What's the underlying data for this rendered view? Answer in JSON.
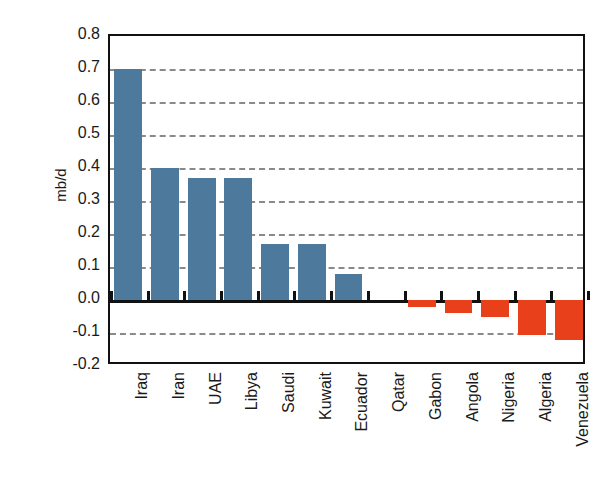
{
  "chart_data": {
    "type": "bar",
    "title": "",
    "xlabel": "",
    "ylabel": "mb/d",
    "ylim": [
      -0.2,
      0.8
    ],
    "ytick_step": 0.1,
    "grid": true,
    "grid_style": "dashed",
    "legend": "none",
    "categories": [
      "Iraq",
      "Iran",
      "UAE",
      "Libya",
      "Saudi",
      "Kuwait",
      "Ecuador",
      "Qatar",
      "Gabon",
      "Angola",
      "Nigeria",
      "Algeria",
      "Venezuela"
    ],
    "values": [
      0.7,
      0.4,
      0.37,
      0.37,
      0.17,
      0.17,
      0.08,
      0.0,
      -0.02,
      -0.04,
      -0.05,
      -0.105,
      -0.12
    ],
    "ytick_labels": [
      "0.8",
      "0.7",
      "0.6",
      "0.5",
      "0.4",
      "0.3",
      "0.2",
      "0.1",
      "0.0",
      "-0.1",
      "-0.2"
    ],
    "ytick_values": [
      0.8,
      0.7,
      0.6,
      0.5,
      0.4,
      0.3,
      0.2,
      0.1,
      0.0,
      -0.1,
      -0.2
    ],
    "colors": {
      "positive": "#4d7a9c",
      "negative": "#e8401a",
      "gridline": "#8a8a8a",
      "axis": "#111111",
      "background": "#ffffff"
    }
  }
}
